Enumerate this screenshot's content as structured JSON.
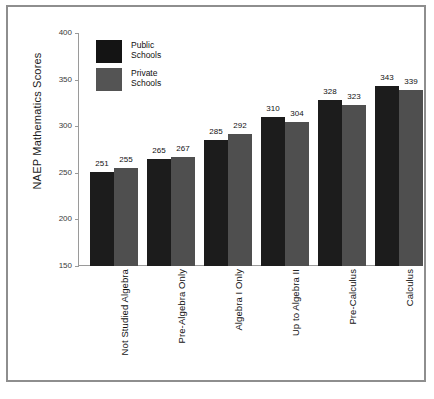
{
  "chart_data": {
    "type": "bar",
    "title": "",
    "xlabel": "",
    "ylabel": "NAEP Mathematics Scores",
    "ylim": [
      150,
      400
    ],
    "yticks": [
      150,
      200,
      250,
      300,
      350,
      400
    ],
    "grid": false,
    "legend_position": "top-left-inside",
    "categories": [
      "Not Studied Algebra",
      "Pre-Algebra Only",
      "Algebra I Only",
      "Up to Algebra II",
      "Pre-Calculus",
      "Calculus"
    ],
    "series": [
      {
        "name": "Public Schools",
        "color": "#1c1c1c",
        "values": [
          251,
          265,
          285,
          310,
          328,
          343
        ]
      },
      {
        "name": "Private Schools",
        "color": "#4f4f4f",
        "values": [
          255,
          267,
          292,
          304,
          323,
          339
        ]
      }
    ]
  },
  "legend": {
    "items": [
      {
        "line1": "Public",
        "line2": "Schools"
      },
      {
        "line1": "Private",
        "line2": "Schools"
      }
    ]
  },
  "caption": {
    "text": ""
  }
}
